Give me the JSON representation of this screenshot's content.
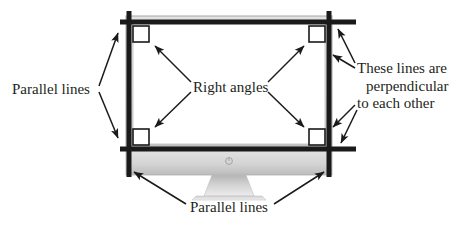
{
  "diagram": {
    "labels": {
      "parallel_left": "Parallel lines",
      "right_angles": "Right angles",
      "perpendicular_line1": "These lines are",
      "perpendicular_line2": "perpendicular",
      "perpendicular_line3": "to each other",
      "parallel_bottom": "Parallel lines"
    },
    "colors": {
      "ink": "#231f20",
      "overlay_line": "#1a1a1a",
      "bezel_light": "#d9d9d9",
      "bezel_mid": "#bdbdbd",
      "bezel_dark": "#9a9a9a",
      "screen_fill": "#ffffff",
      "stand_fill": "#c8c8c8",
      "page_background": "#ffffff"
    },
    "geometry": {
      "overlay_line_thickness_px": 5,
      "right_angle_marker_size_px": 16,
      "right_angle_marker_count": 4,
      "arrow_count": 12
    }
  }
}
